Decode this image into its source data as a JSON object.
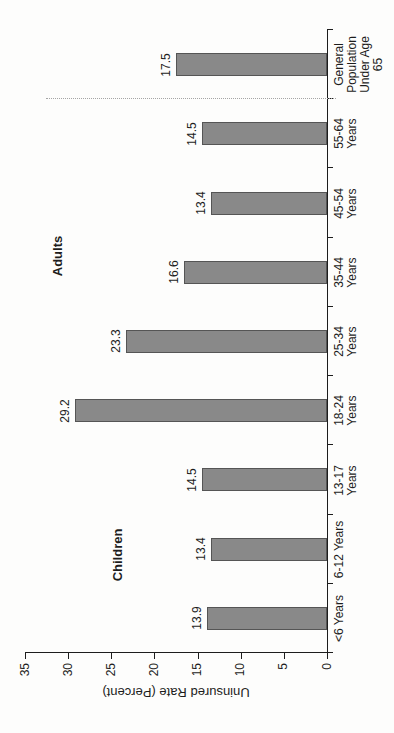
{
  "chart_data": {
    "type": "bar",
    "orientation": "vertical bars; entire figure rotated 90 degrees counter-clockwise on the portrait page",
    "title": "",
    "categories": [
      "<6 Years",
      "6-12 Years",
      "13-17\nYears",
      "18-24\nYears",
      "25-34\nYears",
      "35-44\nYears",
      "45-54\nYears",
      "55-64\nYears",
      "General\nPopulation\nUnder Age\n65"
    ],
    "values": [
      13.9,
      13.4,
      14.5,
      29.2,
      23.3,
      16.6,
      13.4,
      14.5,
      17.5
    ],
    "value_labels": [
      "13.9",
      "13.4",
      "14.5",
      "29.2",
      "23.3",
      "16.6",
      "13.4",
      "14.5",
      "17.5"
    ],
    "xlabel": "",
    "ylabel": "Uninsured Rate (Percent)",
    "ylim": [
      0,
      35
    ],
    "yticks": [
      0,
      5,
      10,
      15,
      20,
      25,
      30,
      35
    ],
    "grid": false,
    "legend": "none",
    "separator_after_index": 7,
    "annotations": [
      {
        "text": "Children",
        "x": 178,
        "y": 117
      },
      {
        "text": "Adults",
        "x": 477,
        "y": 57
      }
    ],
    "colors": {
      "bar_fill": "#898989",
      "bar_border": "#555555",
      "axis": "#1d1d1d",
      "separator": "#a5a5a5",
      "text": "#1d1d1d",
      "background": "#fdfdfc"
    }
  }
}
